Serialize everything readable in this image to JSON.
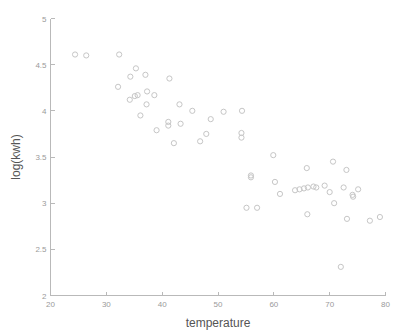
{
  "chart_data": {
    "type": "scatter",
    "title": "",
    "xlabel": "temperature",
    "ylabel": "log(kwh)",
    "xlim": [
      20,
      80
    ],
    "ylim": [
      2,
      5
    ],
    "xticks": [
      20,
      30,
      40,
      50,
      60,
      70,
      80
    ],
    "yticks": [
      2,
      2.5,
      3,
      3.5,
      4,
      4.5,
      5
    ],
    "xtick_labels": [
      "20",
      "30",
      "40",
      "50",
      "60",
      "70",
      "80"
    ],
    "ytick_labels": [
      "2",
      "2.5",
      "3",
      "3.5",
      "4",
      "4.5",
      "5"
    ],
    "grid": false,
    "legend": null,
    "marker": {
      "shape": "circle-open",
      "radius_px": 2.6,
      "color": "#c6c6c6"
    },
    "series": [
      {
        "name": "observations",
        "points": [
          [
            24.4,
            4.61
          ],
          [
            26.4,
            4.6
          ],
          [
            32.3,
            4.61
          ],
          [
            32.1,
            4.26
          ],
          [
            34.3,
            4.37
          ],
          [
            35.3,
            4.46
          ],
          [
            34.2,
            4.12
          ],
          [
            35.1,
            4.16
          ],
          [
            35.6,
            4.17
          ],
          [
            37.3,
            4.21
          ],
          [
            37.0,
            4.39
          ],
          [
            38.6,
            4.17
          ],
          [
            37.2,
            4.07
          ],
          [
            36.1,
            3.95
          ],
          [
            39.0,
            3.79
          ],
          [
            41.1,
            3.88
          ],
          [
            41.1,
            3.84
          ],
          [
            41.3,
            4.35
          ],
          [
            42.1,
            3.65
          ],
          [
            43.1,
            4.07
          ],
          [
            43.3,
            3.86
          ],
          [
            45.4,
            4.0
          ],
          [
            46.8,
            3.67
          ],
          [
            47.9,
            3.75
          ],
          [
            48.7,
            3.91
          ],
          [
            51.0,
            3.99
          ],
          [
            54.3,
            4.0
          ],
          [
            54.2,
            3.76
          ],
          [
            54.2,
            3.71
          ],
          [
            55.1,
            2.95
          ],
          [
            55.9,
            3.3
          ],
          [
            55.9,
            3.28
          ],
          [
            57.0,
            2.95
          ],
          [
            59.9,
            3.52
          ],
          [
            60.2,
            3.23
          ],
          [
            61.1,
            3.1
          ],
          [
            63.8,
            3.14
          ],
          [
            64.6,
            3.15
          ],
          [
            65.4,
            3.16
          ],
          [
            65.9,
            3.38
          ],
          [
            66.1,
            3.17
          ],
          [
            66.0,
            2.88
          ],
          [
            67.1,
            3.18
          ],
          [
            67.6,
            3.17
          ],
          [
            69.1,
            3.19
          ],
          [
            70.0,
            3.12
          ],
          [
            70.6,
            3.45
          ],
          [
            70.8,
            3.0
          ],
          [
            72.0,
            2.31
          ],
          [
            72.5,
            3.17
          ],
          [
            73.0,
            3.36
          ],
          [
            73.1,
            2.83
          ],
          [
            74.1,
            3.09
          ],
          [
            74.2,
            3.07
          ],
          [
            75.1,
            3.15
          ],
          [
            77.2,
            2.81
          ],
          [
            79.0,
            2.85
          ]
        ]
      }
    ]
  },
  "axes": {
    "x_title": "temperature",
    "y_title": "log(kwh)"
  }
}
